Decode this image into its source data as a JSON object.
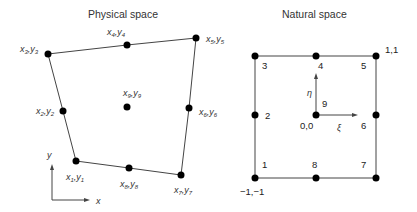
{
  "physical": {
    "title": "Physical space",
    "nodes": [
      {
        "id": 1,
        "x": 76,
        "y": 161,
        "var": "x",
        "sub": "1",
        "var2": "y",
        "sub2": "1",
        "lx": 66,
        "ly": 180
      },
      {
        "id": 2,
        "x": 63,
        "y": 111,
        "var": "x",
        "sub": "2",
        "var2": "y",
        "sub2": "2",
        "lx": 36,
        "ly": 114
      },
      {
        "id": 3,
        "x": 48,
        "y": 54,
        "var": "x",
        "sub": "3",
        "var2": "y",
        "sub2": "3",
        "lx": 20,
        "ly": 52
      },
      {
        "id": 4,
        "x": 127,
        "y": 45,
        "var": "x",
        "sub": "4",
        "var2": "y",
        "sub2": "4",
        "lx": 107,
        "ly": 35
      },
      {
        "id": 5,
        "x": 196,
        "y": 38,
        "var": "x",
        "sub": "5",
        "var2": "y",
        "sub2": "5",
        "lx": 206,
        "ly": 42
      },
      {
        "id": 6,
        "x": 189,
        "y": 108,
        "var": "x",
        "sub": "6",
        "var2": "y",
        "sub2": "6",
        "lx": 199,
        "ly": 115
      },
      {
        "id": 7,
        "x": 181,
        "y": 175,
        "var": "x",
        "sub": "7",
        "var2": "y",
        "sub2": "7",
        "lx": 174,
        "ly": 193
      },
      {
        "id": 8,
        "x": 129,
        "y": 168,
        "var": "x",
        "sub": "8",
        "var2": "y",
        "sub2": "8",
        "lx": 120,
        "ly": 187
      },
      {
        "id": 9,
        "x": 127,
        "y": 107,
        "var": "x",
        "sub": "9",
        "var2": "y",
        "sub2": "9",
        "lx": 123,
        "ly": 96
      }
    ],
    "axes": {
      "x_label": "x",
      "y_label": "y"
    }
  },
  "natural": {
    "title": "Natural space",
    "nodes": [
      {
        "id": "1",
        "x": 255,
        "y": 178,
        "lx": 262,
        "ly": 168
      },
      {
        "id": "2",
        "x": 255,
        "y": 115,
        "lx": 265,
        "ly": 119
      },
      {
        "id": "3",
        "x": 255,
        "y": 56,
        "lx": 262,
        "ly": 69
      },
      {
        "id": "4",
        "x": 316,
        "y": 56,
        "lx": 318,
        "ly": 69
      },
      {
        "id": "5",
        "x": 376,
        "y": 56,
        "lx": 361,
        "ly": 69
      },
      {
        "id": "6",
        "x": 376,
        "y": 115,
        "lx": 361,
        "ly": 129
      },
      {
        "id": "7",
        "x": 376,
        "y": 178,
        "lx": 361,
        "ly": 168
      },
      {
        "id": "8",
        "x": 316,
        "y": 178,
        "lx": 312,
        "ly": 168
      },
      {
        "id": "9",
        "x": 316,
        "y": 115,
        "lx": 322,
        "ly": 107
      }
    ],
    "corner_labels": {
      "top_right": "1,1",
      "bottom_left": "−1,−1",
      "center": "0,0"
    },
    "axes": {
      "xi": "ξ",
      "eta": "η"
    }
  }
}
